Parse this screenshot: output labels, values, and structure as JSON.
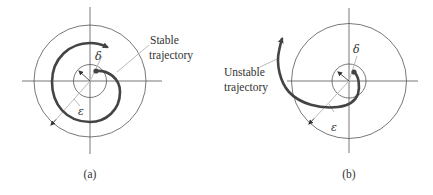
{
  "figure": {
    "panels": [
      {
        "id": "a",
        "caption": "(a)",
        "trajectory_label_line1": "Stable",
        "trajectory_label_line2": "trajectory",
        "delta_symbol": "δ",
        "epsilon_symbol": "ε",
        "trajectory_type": "stable"
      },
      {
        "id": "b",
        "caption": "(b)",
        "trajectory_label_line1": "Unstable",
        "trajectory_label_line2": "trajectory",
        "delta_symbol": "δ",
        "epsilon_symbol": "ε",
        "trajectory_type": "unstable"
      }
    ],
    "colors": {
      "axis": "#555555",
      "circle": "#555555",
      "trajectory": "#444444",
      "leader": "#bbbbbb",
      "text": "#333333"
    }
  }
}
